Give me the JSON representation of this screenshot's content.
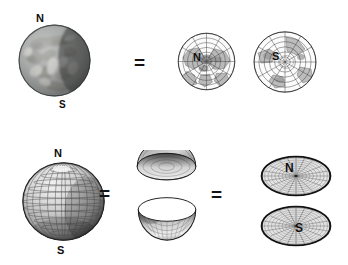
{
  "figure": {
    "title": "",
    "background_color": "#ffffff",
    "width": 348,
    "height": 265,
    "rows": [
      {
        "id": "row-top",
        "description": "Photographic Earth equals two polar hemisphere map projections",
        "items": [
          {
            "id": "earth-photo",
            "kind": "photographic-globe",
            "labels": [
              {
                "text": "N",
                "position": "top"
              },
              {
                "text": "S",
                "position": "bottom"
              }
            ]
          },
          {
            "id": "equals-top-1",
            "kind": "operator",
            "text": "="
          },
          {
            "id": "polar-north",
            "kind": "polar-map-projection",
            "labels": [
              {
                "text": "N",
                "position": "center"
              }
            ]
          },
          {
            "id": "polar-south",
            "kind": "polar-map-projection",
            "labels": [
              {
                "text": "S",
                "position": "center"
              }
            ]
          }
        ]
      },
      {
        "id": "row-bottom",
        "description": "Wireframe globe equals two hemispherical bowls equals two flat polar disks",
        "items": [
          {
            "id": "wire-globe",
            "kind": "wireframe-globe",
            "labels": [
              {
                "text": "N",
                "position": "top"
              },
              {
                "text": "S",
                "position": "bottom"
              }
            ]
          },
          {
            "id": "equals-bottom-1",
            "kind": "operator",
            "text": "="
          },
          {
            "id": "bowl-north",
            "kind": "hemisphere-dome"
          },
          {
            "id": "bowl-south",
            "kind": "hemisphere-bowl"
          },
          {
            "id": "equals-bottom-2",
            "kind": "operator",
            "text": "="
          },
          {
            "id": "disk-north",
            "kind": "flat-polar-disk",
            "labels": [
              {
                "text": "N",
                "position": "center"
              }
            ]
          },
          {
            "id": "disk-south",
            "kind": "flat-polar-disk",
            "labels": [
              {
                "text": "S",
                "position": "center"
              }
            ]
          }
        ]
      }
    ],
    "labels": {
      "north": "N",
      "south": "S",
      "equals": "="
    },
    "colors": {
      "ink": "#0d0d0d",
      "grid": "#555555",
      "grid_light": "#8d8d8d",
      "outline": "#1a1a1a",
      "sphere_light": "#e8e8e8",
      "sphere_mid": "#b5b5b5",
      "sphere_dark": "#4a4a4a",
      "background": "#ffffff",
      "land": "#8a8a82",
      "ocean": "#9aa0a4"
    }
  }
}
